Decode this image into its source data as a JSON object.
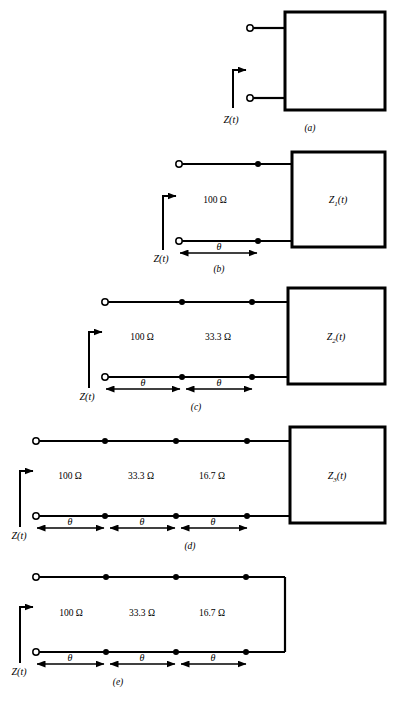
{
  "figure": {
    "type": "transmission-line-cascade-diagram",
    "panel_count": 5,
    "input_impedance_label": "Z(t)",
    "theta_label": "θ",
    "ohm_symbol": "Ω"
  },
  "panels": [
    {
      "id": "a",
      "caption": "(a)",
      "input_label": "Z(t)",
      "sections": [],
      "load": {
        "label": "",
        "shown": false
      },
      "terminated": "box",
      "box_label": ""
    },
    {
      "id": "b",
      "caption": "(b)",
      "input_label": "Z(t)",
      "sections": [
        {
          "impedance": "100 Ω",
          "length": "θ"
        }
      ],
      "load": {
        "label_base": "Z",
        "label_sub": "1",
        "label_arg": "(t)",
        "shown": true
      },
      "terminated": "box",
      "box_label": "Z₁(t)"
    },
    {
      "id": "c",
      "caption": "(c)",
      "input_label": "Z(t)",
      "sections": [
        {
          "impedance": "100 Ω",
          "length": "θ"
        },
        {
          "impedance": "33.3 Ω",
          "length": "θ"
        }
      ],
      "load": {
        "label_base": "Z",
        "label_sub": "2",
        "label_arg": "(t)",
        "shown": true
      },
      "terminated": "box",
      "box_label": "Z₂(t)"
    },
    {
      "id": "d",
      "caption": "(d)",
      "input_label": "Z(t)",
      "sections": [
        {
          "impedance": "100 Ω",
          "length": "θ"
        },
        {
          "impedance": "33.3 Ω",
          "length": "θ"
        },
        {
          "impedance": "16.7 Ω",
          "length": "θ"
        }
      ],
      "load": {
        "label_base": "Z",
        "label_sub": "3",
        "label_arg": "(t)",
        "shown": true
      },
      "terminated": "box",
      "box_label": "Z₃(t)"
    },
    {
      "id": "e",
      "caption": "(e)",
      "input_label": "Z(t)",
      "sections": [
        {
          "impedance": "100 Ω",
          "length": "θ"
        },
        {
          "impedance": "33.3 Ω",
          "length": "θ"
        },
        {
          "impedance": "16.7 Ω",
          "length": "θ"
        }
      ],
      "load": {
        "label": "",
        "shown": false
      },
      "terminated": "short-circuit",
      "box_label": ""
    }
  ],
  "style": {
    "line_color": "#000000",
    "background": "#ffffff"
  }
}
